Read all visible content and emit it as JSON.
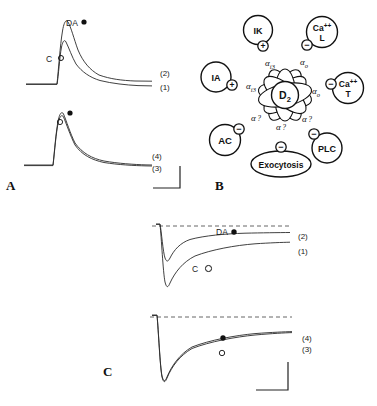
{
  "figure": {
    "panels": [
      {
        "id": "A",
        "letter": "A"
      },
      {
        "id": "B",
        "letter": "B"
      },
      {
        "id": "C",
        "letter": "C"
      }
    ]
  },
  "panel_a": {
    "upper_trace": {
      "label_da": "DA",
      "marker_da": "●",
      "label_c": "C",
      "marker_c": "○",
      "number_upper": "(2)",
      "number_lower": "(1)"
    },
    "lower_trace": {
      "marker_filled": "●",
      "marker_open": "○",
      "number_upper": "(4)",
      "number_lower": "(3)"
    }
  },
  "panel_b": {
    "center": "D2",
    "center_sub": "2",
    "center_main": "D",
    "nodes": [
      {
        "name": "IK",
        "sign": "+",
        "coupler": "αi3",
        "alpha_main": "α",
        "alpha_sub": "i3"
      },
      {
        "name": "Ca²⁺ L",
        "sign": "−",
        "coupler": "αo",
        "alpha_main": "α",
        "alpha_sub": "o"
      },
      {
        "name": "Ca²⁺ T",
        "sign": "−",
        "coupler": "αo",
        "alpha_main": "α",
        "alpha_sub": "o"
      },
      {
        "name": "PLC",
        "sign": "−",
        "coupler": "α?",
        "alpha_main": "α",
        "alpha_sub": "?"
      },
      {
        "name": "Exocytosis",
        "sign": "−",
        "coupler": "α?",
        "alpha_main": "α",
        "alpha_sub": "?"
      },
      {
        "name": "AC",
        "sign": "−",
        "coupler": "α?",
        "alpha_main": "α",
        "alpha_sub": "?"
      },
      {
        "name": "IA",
        "sign": "+",
        "coupler": "αi3",
        "alpha_main": "α",
        "alpha_sub": "i3"
      }
    ],
    "node_ik": "IK",
    "node_ca_l_main": "Ca",
    "node_ca_l_sup": "++",
    "node_ca_l_sub": "L",
    "node_ca_t_main": "Ca",
    "node_ca_t_sup": "++",
    "node_ca_t_sub": "T",
    "node_plc": "PLC",
    "node_exocytosis": "Exocytosis",
    "node_ac": "AC",
    "node_ia": "IA",
    "sign_plus": "+",
    "sign_minus": "−",
    "alpha": "α",
    "sub_i3": "i3",
    "sub_o": "o",
    "sub_q": "?"
  },
  "panel_c": {
    "upper_trace": {
      "label_da": "DA",
      "marker_da": "●",
      "label_c": "C",
      "marker_c": "○",
      "number_upper": "(2)",
      "number_lower": "(1)"
    },
    "lower_trace": {
      "marker_filled": "●",
      "marker_open": "○",
      "number_upper": "(4)",
      "number_lower": "(3)"
    }
  },
  "colors": {
    "ink": "#1a1a1a",
    "background": "#ffffff",
    "trace": "#2b2b2b",
    "dashed": "#555555"
  }
}
